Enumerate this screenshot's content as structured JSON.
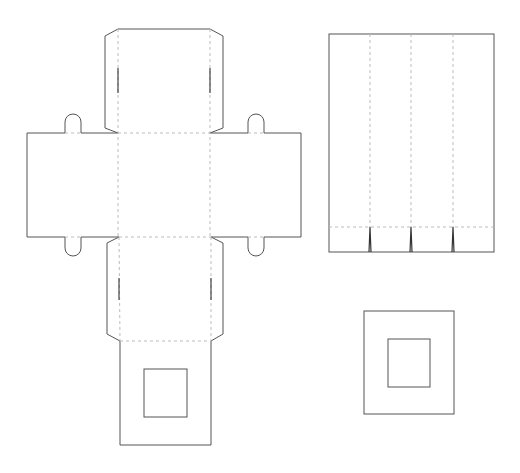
{
  "diagram": {
    "type": "box-template-dieline",
    "colors": {
      "background": "#ffffff",
      "cut_line": "#555555",
      "fold_line": "#bbbbbb"
    },
    "legend": {
      "solid_line": "cut",
      "dashed_line": "fold"
    },
    "pieces": [
      {
        "name": "box-net",
        "panels": [
          "top-flap",
          "left-side-panel",
          "center-panel",
          "right-side-panel",
          "lower-flap",
          "bottom-window-panel"
        ],
        "tabs": 4,
        "window": true
      },
      {
        "name": "sleeve-strip",
        "columns": 4,
        "bottom_fold_with_notches": 3
      },
      {
        "name": "window-frame",
        "window": true
      }
    ]
  }
}
